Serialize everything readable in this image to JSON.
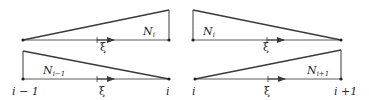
{
  "diagram": {
    "colors": {
      "line": "#3a3a3a",
      "axis": "#4a4a4a",
      "text": "#2a2a2a",
      "background": "#ffffff"
    },
    "panels": [
      {
        "id": "top-left",
        "shape_label": {
          "base": "N",
          "sub": "i"
        },
        "coord_label": "ξ",
        "node_labels": []
      },
      {
        "id": "top-right",
        "shape_label": {
          "base": "N",
          "sub": "i"
        },
        "coord_label": "ξ",
        "node_labels": []
      },
      {
        "id": "bottom-left",
        "shape_label": {
          "base": "N",
          "sub": "i−1"
        },
        "coord_label": "ξ",
        "node_labels": [
          "i − 1",
          "i"
        ]
      },
      {
        "id": "bottom-right",
        "shape_label": {
          "base": "N",
          "sub": "i+1"
        },
        "coord_label": "ξ",
        "node_labels": [
          "i",
          "i +1"
        ]
      }
    ]
  }
}
